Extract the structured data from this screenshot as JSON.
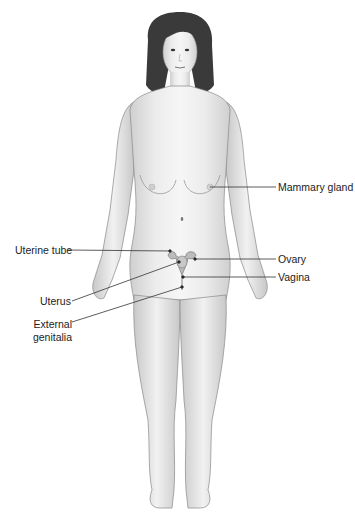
{
  "diagram": {
    "labels": [
      {
        "id": "mammary-gland",
        "text": "Mammary gland",
        "side": "right"
      },
      {
        "id": "uterine-tube",
        "text": "Uterine tube",
        "side": "left"
      },
      {
        "id": "ovary",
        "text": "Ovary",
        "side": "right"
      },
      {
        "id": "vagina",
        "text": "Vagina",
        "side": "right"
      },
      {
        "id": "uterus",
        "text": "Uterus",
        "side": "left"
      },
      {
        "id": "external-genitalia-line1",
        "text": "External",
        "side": "left"
      },
      {
        "id": "external-genitalia-line2",
        "text": "genitalia",
        "side": "left"
      }
    ]
  }
}
